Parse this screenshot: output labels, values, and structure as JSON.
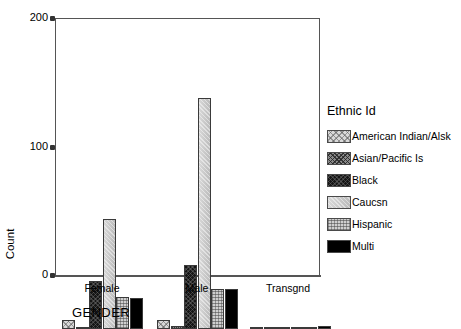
{
  "chart_data": {
    "type": "bar",
    "title": "",
    "xlabel": "GENDER",
    "ylabel": "Count",
    "ylim": [
      0,
      200
    ],
    "yticks": [
      "0",
      "100",
      "200"
    ],
    "grid": false,
    "legend_position": "right",
    "legend_title": "Ethnic Id",
    "categories": [
      "Female",
      "Male",
      "Transgnd"
    ],
    "series": [
      {
        "name": "American Indian/Alsk",
        "values": [
          7,
          7,
          0
        ]
      },
      {
        "name": "Asian/Pacific Is",
        "values": [
          1,
          2,
          0
        ]
      },
      {
        "name": "Black",
        "values": [
          37,
          50,
          0
        ]
      },
      {
        "name": "Caucsn",
        "values": [
          86,
          180,
          1
        ]
      },
      {
        "name": "Hispanic",
        "values": [
          25,
          31,
          1
        ]
      },
      {
        "name": "Multi",
        "values": [
          24,
          31,
          2
        ]
      }
    ]
  },
  "axes": {
    "y_title": "Count",
    "x_title": "GENDER",
    "y_tick_200": "200",
    "y_tick_100": "100",
    "y_tick_0": "0",
    "x_cat_0": "Female",
    "x_cat_1": "Male",
    "x_cat_2": "Transgnd"
  },
  "legend": {
    "title": "Ethnic Id",
    "items": [
      {
        "label": "American Indian/Alsk",
        "pattern": "crosshatch-light",
        "color": "#d8d8d8"
      },
      {
        "label": "Asian/Pacific Is",
        "pattern": "crosshatch-dark",
        "color": "#8a8a8a"
      },
      {
        "label": "Black",
        "pattern": "dense-dark",
        "color": "#151515"
      },
      {
        "label": "Caucsn",
        "pattern": "light-solid",
        "color": "#c4c4c4"
      },
      {
        "label": "Hispanic",
        "pattern": "grid-medium",
        "color": "#cfcfcf"
      },
      {
        "label": "Multi",
        "pattern": "solid-black",
        "color": "#000000"
      }
    ]
  },
  "title_remnant": "............"
}
